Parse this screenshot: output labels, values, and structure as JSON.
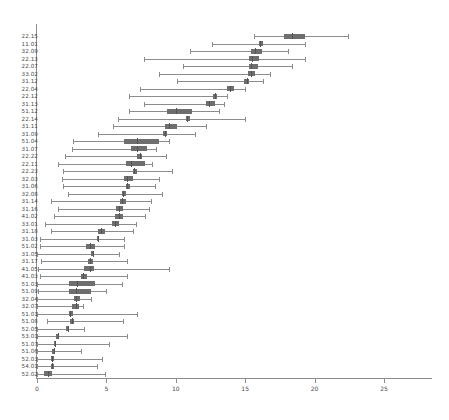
{
  "chart_data": {
    "type": "box",
    "orientation": "horizontal",
    "title": "",
    "xlabel": "",
    "ylabel": "",
    "xlim": [
      0,
      28.5
    ],
    "xticks": [
      0,
      5,
      10,
      15,
      20,
      25
    ],
    "xtick_labels": [
      "0",
      "5",
      "10",
      "15",
      "20",
      "25"
    ],
    "grid": false,
    "legend": null,
    "colors": {
      "box_fill": "#6e6e6e",
      "whisker": "#8c8c8c",
      "median": "#545454",
      "axis": "#8c8c8c",
      "text": "#4a4a4a",
      "background": "#ffffff"
    },
    "categories": [
      "22.15",
      "11.01",
      "32.09",
      "22.13",
      "22.07",
      "33.02",
      "31.12",
      "22.04",
      "22.12",
      "31.13",
      "51.12",
      "22.14",
      "31.11",
      "31.09",
      "51.04",
      "31.07",
      "22.22",
      "22.11",
      "22.23",
      "32.03",
      "31.06",
      "32.08",
      "31.14",
      "31.16",
      "41.02",
      "33.01",
      "31.18",
      "31.03",
      "51.02",
      "31.05",
      "31.17",
      "41.05",
      "41.03",
      "51.03",
      "51.09",
      "32.04",
      "32.07",
      "51.01",
      "51.08",
      "52.05",
      "53.01",
      "51.07",
      "51.06",
      "52.03",
      "54.01",
      "52.02"
    ],
    "boxes": [
      {
        "label": "22.15",
        "min": 15.6,
        "q1": 17.8,
        "median": 18.4,
        "q3": 19.3,
        "max": 22.4
      },
      {
        "label": "11.01",
        "min": 12.6,
        "q1": 16.0,
        "median": 16.1,
        "q3": 16.3,
        "max": 19.3
      },
      {
        "label": "32.09",
        "min": 11.0,
        "q1": 15.4,
        "median": 15.7,
        "q3": 16.2,
        "max": 18.1
      },
      {
        "label": "22.13",
        "min": 7.7,
        "q1": 15.3,
        "median": 15.5,
        "q3": 16.0,
        "max": 19.3
      },
      {
        "label": "22.07",
        "min": 10.5,
        "q1": 15.3,
        "median": 15.4,
        "q3": 15.9,
        "max": 18.4
      },
      {
        "label": "33.02",
        "min": 8.8,
        "q1": 15.2,
        "median": 15.4,
        "q3": 15.7,
        "max": 16.8
      },
      {
        "label": "31.12",
        "min": 10.1,
        "q1": 14.9,
        "median": 15.1,
        "q3": 15.3,
        "max": 16.3
      },
      {
        "label": "22.04",
        "min": 7.4,
        "q1": 13.7,
        "median": 13.9,
        "q3": 14.2,
        "max": 15.0
      },
      {
        "label": "22.12",
        "min": 6.6,
        "q1": 12.7,
        "median": 12.8,
        "q3": 13.0,
        "max": 13.7
      },
      {
        "label": "31.13",
        "min": 7.7,
        "q1": 12.2,
        "median": 12.4,
        "q3": 12.8,
        "max": 13.5
      },
      {
        "label": "51.12",
        "min": 6.6,
        "q1": 9.4,
        "median": 10.0,
        "q3": 11.2,
        "max": 13.1
      },
      {
        "label": "22.14",
        "min": 5.8,
        "q1": 10.7,
        "median": 10.8,
        "q3": 11.0,
        "max": 15.0
      },
      {
        "label": "31.11",
        "min": 5.5,
        "q1": 9.2,
        "median": 9.5,
        "q3": 10.1,
        "max": 12.2
      },
      {
        "label": "31.09",
        "min": 4.4,
        "q1": 9.1,
        "median": 9.2,
        "q3": 9.4,
        "max": 11.4
      },
      {
        "label": "51.04",
        "min": 2.6,
        "q1": 6.3,
        "median": 7.2,
        "q3": 8.8,
        "max": 9.5
      },
      {
        "label": "31.07",
        "min": 2.5,
        "q1": 6.8,
        "median": 7.2,
        "q3": 7.9,
        "max": 8.6
      },
      {
        "label": "22.22",
        "min": 2.0,
        "q1": 7.2,
        "median": 7.4,
        "q3": 7.6,
        "max": 9.3
      },
      {
        "label": "22.11",
        "min": 1.5,
        "q1": 6.4,
        "median": 6.8,
        "q3": 7.8,
        "max": 8.3
      },
      {
        "label": "22.23",
        "min": 1.9,
        "q1": 6.9,
        "median": 7.0,
        "q3": 7.2,
        "max": 9.7
      },
      {
        "label": "32.03",
        "min": 1.8,
        "q1": 6.3,
        "median": 6.5,
        "q3": 6.9,
        "max": 8.8
      },
      {
        "label": "31.06",
        "min": 1.9,
        "q1": 6.4,
        "median": 6.5,
        "q3": 6.7,
        "max": 8.5
      },
      {
        "label": "32.08",
        "min": 2.2,
        "q1": 6.1,
        "median": 6.2,
        "q3": 6.4,
        "max": 9.0
      },
      {
        "label": "31.14",
        "min": 1.0,
        "q1": 6.0,
        "median": 6.1,
        "q3": 6.4,
        "max": 8.2
      },
      {
        "label": "31.16",
        "min": 1.5,
        "q1": 5.7,
        "median": 5.9,
        "q3": 6.2,
        "max": 8.1
      },
      {
        "label": "41.02",
        "min": 1.2,
        "q1": 5.6,
        "median": 5.9,
        "q3": 6.2,
        "max": 7.8
      },
      {
        "label": "33.01",
        "min": 0.6,
        "q1": 5.4,
        "median": 5.6,
        "q3": 5.9,
        "max": 7.1
      },
      {
        "label": "31.18",
        "min": 1.0,
        "q1": 4.4,
        "median": 4.6,
        "q3": 4.9,
        "max": 6.9
      },
      {
        "label": "31.03",
        "min": 0.2,
        "q1": 4.3,
        "median": 4.4,
        "q3": 4.5,
        "max": 6.3
      },
      {
        "label": "51.02",
        "min": 0.2,
        "q1": 3.5,
        "median": 3.8,
        "q3": 4.2,
        "max": 6.3
      },
      {
        "label": "31.05",
        "min": 0.0,
        "q1": 3.9,
        "median": 4.0,
        "q3": 4.1,
        "max": 5.9
      },
      {
        "label": "31.17",
        "min": 0.3,
        "q1": 3.7,
        "median": 3.8,
        "q3": 4.0,
        "max": 6.5
      },
      {
        "label": "41.05",
        "min": 0.1,
        "q1": 3.4,
        "median": 3.8,
        "q3": 4.1,
        "max": 9.5
      },
      {
        "label": "41.03",
        "min": 0.2,
        "q1": 3.2,
        "median": 3.3,
        "q3": 3.6,
        "max": 6.5
      },
      {
        "label": "51.03",
        "min": 0.0,
        "q1": 2.3,
        "median": 2.9,
        "q3": 4.2,
        "max": 6.1
      },
      {
        "label": "51.09",
        "min": 0.1,
        "q1": 2.3,
        "median": 2.8,
        "q3": 3.9,
        "max": 5.0
      },
      {
        "label": "32.04",
        "min": 0.0,
        "q1": 2.7,
        "median": 2.8,
        "q3": 3.1,
        "max": 3.9
      },
      {
        "label": "32.07",
        "min": 0.0,
        "q1": 2.5,
        "median": 2.8,
        "q3": 3.0,
        "max": 3.3
      },
      {
        "label": "51.01",
        "min": 0.0,
        "q1": 2.3,
        "median": 2.4,
        "q3": 2.6,
        "max": 7.2
      },
      {
        "label": "51.08",
        "min": 0.7,
        "q1": 2.4,
        "median": 2.5,
        "q3": 2.7,
        "max": 6.2
      },
      {
        "label": "52.05",
        "min": 0.0,
        "q1": 2.1,
        "median": 2.2,
        "q3": 2.3,
        "max": 3.4
      },
      {
        "label": "53.01",
        "min": 0.0,
        "q1": 1.4,
        "median": 1.5,
        "q3": 1.6,
        "max": 6.5
      },
      {
        "label": "51.07",
        "min": 0.0,
        "q1": 1.2,
        "median": 1.3,
        "q3": 1.4,
        "max": 5.2
      },
      {
        "label": "51.06",
        "min": 0.0,
        "q1": 1.1,
        "median": 1.2,
        "q3": 1.3,
        "max": 3.2
      },
      {
        "label": "52.03",
        "min": 0.0,
        "q1": 1.0,
        "median": 1.1,
        "q3": 1.2,
        "max": 4.7
      },
      {
        "label": "54.01",
        "min": 0.0,
        "q1": 1.0,
        "median": 1.1,
        "q3": 1.2,
        "max": 4.3
      },
      {
        "label": "52.02",
        "min": 0.0,
        "q1": 0.5,
        "median": 0.8,
        "q3": 1.1,
        "max": 4.9
      }
    ]
  },
  "axes": {
    "x_tick_labels": [
      "0",
      "5",
      "10",
      "15",
      "20",
      "25"
    ]
  }
}
